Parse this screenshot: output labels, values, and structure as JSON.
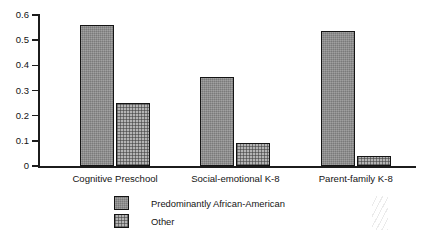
{
  "chart_data": {
    "type": "bar",
    "title": "",
    "subtitle": "",
    "xlabel": "",
    "ylabel": "",
    "ylim": [
      0,
      0.6
    ],
    "yticks": [
      "0",
      "0.1",
      "0.2",
      "0.3",
      "0.4",
      "0.5",
      "0.6"
    ],
    "ytick_values": [
      0,
      0.1,
      0.2,
      0.3,
      0.4,
      0.5,
      0.6
    ],
    "grid": false,
    "legend_position": "bottom-center",
    "categories": [
      "Cognitive Preschool",
      "Social-emotional K-8",
      "Parent-family K-8"
    ],
    "series": [
      {
        "name": "Predominantly African-American",
        "values": [
          0.56,
          0.355,
          0.535
        ],
        "color": "#8a8a8a"
      },
      {
        "name": "Other",
        "values": [
          0.25,
          0.09,
          0.04
        ],
        "color": "#b4b4b4"
      }
    ]
  },
  "legend": {
    "items": [
      {
        "label": "Predominantly African-American"
      },
      {
        "label": "Other"
      }
    ]
  }
}
